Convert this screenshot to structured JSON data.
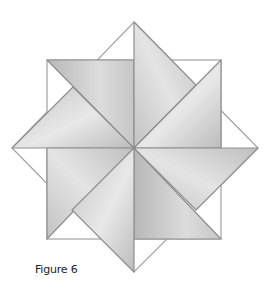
{
  "figure": {
    "caption": "Figure 6",
    "colors": {
      "background": "#ffffff",
      "outline": "#9a9a9a",
      "shade_light": "#e6e6e6",
      "shade_dark": "#bdbdbd",
      "edge": "#8f8f8f"
    },
    "geometry": {
      "center": [
        134,
        148
      ],
      "square": {
        "left": 47,
        "top": 60,
        "right": 221,
        "bottom": 239
      },
      "diamond": {
        "top": [
          134,
          22
        ],
        "right": [
          258,
          148
        ],
        "bottom": [
          134,
          272
        ],
        "left": [
          12,
          148
        ]
      }
    }
  }
}
